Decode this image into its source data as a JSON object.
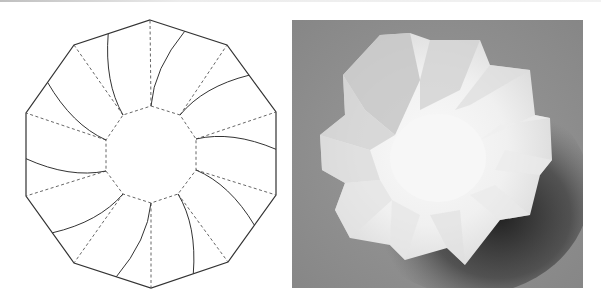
{
  "figure": {
    "left_panel": {
      "name": "crease-pattern",
      "shape": "decagon",
      "sides": 10,
      "center": [
        151,
        154
      ],
      "outer_vertices": [
        [
          150,
          20
        ],
        [
          227,
          45
        ],
        [
          276,
          112
        ],
        [
          276,
          195
        ],
        [
          228,
          262
        ],
        [
          151,
          288
        ],
        [
          74,
          263
        ],
        [
          26,
          196
        ],
        [
          26,
          113
        ],
        [
          74,
          45
        ]
      ],
      "inner_vertices": [
        [
          151,
          106
        ],
        [
          180,
          115
        ],
        [
          196,
          139
        ],
        [
          196,
          170
        ],
        [
          178,
          194
        ],
        [
          151,
          203
        ],
        [
          123,
          194
        ],
        [
          106,
          171
        ],
        [
          106,
          140
        ],
        [
          123,
          115
        ]
      ],
      "line_color": "#333333",
      "legend": {
        "solid_line": "mountain/curved fold",
        "dashed_line": "valley fold"
      }
    },
    "right_panel": {
      "name": "folded-paper-bowl-photo",
      "background_color": "#8a8a8a",
      "paper_color": "#f4f4f4",
      "petal_count": 10
    }
  }
}
